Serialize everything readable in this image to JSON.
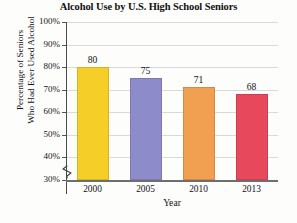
{
  "chart_data": {
    "type": "bar",
    "title": "Alcohol Use by U.S. High School Seniors",
    "xlabel": "Year",
    "ylabel": "Percentage of Seniors Who Had Ever Used Alcohol",
    "ylabel_line1": "Percentage of Seniors",
    "ylabel_line2": "Who Had Ever Used Alcohol",
    "categories": [
      "2000",
      "2005",
      "2010",
      "2013"
    ],
    "values": [
      80,
      75,
      71,
      68
    ],
    "value_labels": [
      "80",
      "75",
      "71",
      "68"
    ],
    "ylim": [
      30,
      100
    ],
    "y_ticks": [
      "30%",
      "40%",
      "50%",
      "60%",
      "70%",
      "80%",
      "90%",
      "100%"
    ],
    "y_tick_values": [
      30,
      40,
      50,
      60,
      70,
      80,
      90,
      100
    ],
    "grid": true,
    "legend": "none",
    "axis_break": true,
    "bar_colors": [
      "#F5CE27",
      "#8E8BCB",
      "#F0A050",
      "#E8485C"
    ],
    "gridline_color": "#d9d9d9",
    "axis_color": "#4a4a4a"
  }
}
